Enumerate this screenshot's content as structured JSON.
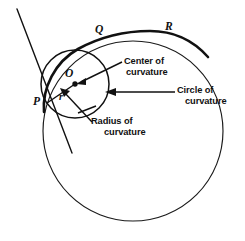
{
  "figure": {
    "type": "geometry-diagram",
    "background_color": "#ffffff",
    "ink_color": "#111111"
  },
  "point_labels": {
    "P": "P",
    "Q": "Q",
    "R": "R",
    "O": "O",
    "r": "r"
  },
  "callouts": {
    "center": {
      "line1": "Center of",
      "line2": "curvature"
    },
    "circle": {
      "line1": "Circle of",
      "line2": "curvature"
    },
    "radius": {
      "line1": "Radius of",
      "line2": "curvature"
    }
  },
  "geometry": {
    "big_circle": {
      "cx": 133,
      "cy": 131,
      "r": 90
    },
    "small_circle": {
      "cx": 75,
      "cy": 84,
      "r": 34
    },
    "center_dot": {
      "cx": 75,
      "cy": 84,
      "r": 2.6
    },
    "tangent_point_P": {
      "x": 47,
      "y": 103
    },
    "point_Q": {
      "x": 103,
      "y": 37
    },
    "point_R": {
      "x": 172,
      "y": 32
    }
  },
  "icon_names": {
    "arrow_center": "arrow-left-icon",
    "arrow_circle": "arrow-left-icon",
    "arrow_radius": "arrow-up-left-icon"
  }
}
